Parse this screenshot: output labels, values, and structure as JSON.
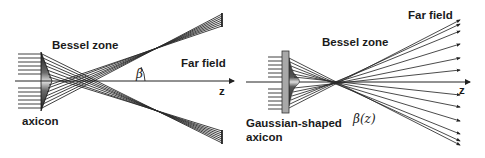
{
  "diagram": {
    "type": "optics-schematic",
    "colors": {
      "ray": "#2a2a2a",
      "axis": "#222222",
      "text": "#1a1a1a",
      "axicon_dark": "#1e1e1e",
      "axicon_light": "#d9d9d9",
      "plate": "#9a9a9a"
    },
    "left_panel": {
      "title": "Conventional axicon",
      "labels": {
        "bessel_zone": "Bessel zone",
        "far_field": "Far field",
        "angle": "β",
        "axis": "z",
        "element": "axicon"
      },
      "incoming_ray_count": 12,
      "outgoing_bundles": [
        "upper",
        "lower"
      ]
    },
    "right_panel": {
      "title": "Gaussian-shaped axicon",
      "labels": {
        "far_field": "Far field",
        "bessel_zone": "Bessel zone",
        "axis": "z",
        "angle": "β(z)",
        "element_line1": "Gaussian-shaped",
        "element_line2": "axicon"
      },
      "incoming_ray_count": 12,
      "outgoing_bundles": [
        "fanned"
      ]
    }
  }
}
